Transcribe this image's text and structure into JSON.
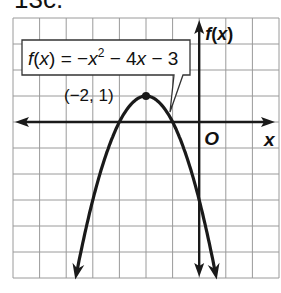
{
  "heading": "13c.",
  "chart_data": {
    "type": "line",
    "title": "",
    "function_label": "f(x) = −x² − 4x − 3",
    "function_parts": {
      "lhs": "f(x) = ",
      "rest": "−x",
      "exp": "2",
      "tail": " − 4x − 3"
    },
    "xlabel": "x",
    "ylabel": "f(x)",
    "origin_label": "O",
    "xlim": [
      -7,
      3
    ],
    "ylim": [
      -6,
      4
    ],
    "grid": true,
    "vertex": {
      "x": -2,
      "y": 1,
      "label": "(−2, 1)"
    },
    "coefficients": {
      "a": -1,
      "b": -4,
      "c": -3
    },
    "x_intercepts": [
      -3,
      -1
    ],
    "y_intercept": -3,
    "points": [
      {
        "x": -4.6,
        "y": -6.76
      },
      {
        "x": -4,
        "y": -3
      },
      {
        "x": -3,
        "y": 0
      },
      {
        "x": -2,
        "y": 1
      },
      {
        "x": -1,
        "y": 0
      },
      {
        "x": 0,
        "y": -3
      },
      {
        "x": 0.6,
        "y": -6.76
      }
    ]
  },
  "colors": {
    "curve": "#1a1a1a",
    "grid": "#9a9a9a",
    "axis": "#1a1a1a",
    "background": "#ffffff"
  }
}
